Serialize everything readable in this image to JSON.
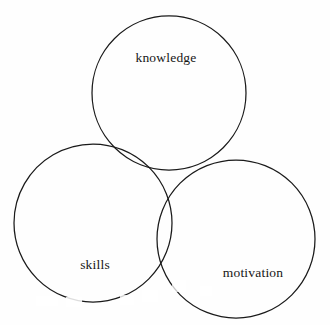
{
  "diagram": {
    "type": "three-circle-venn",
    "background_color": "#fefefe",
    "stroke_color": "#1a1a1a",
    "title": "",
    "circles": [
      {
        "id": "knowledge",
        "label": "knowledge",
        "position": "top",
        "cx": 169,
        "cy": 93,
        "r": 77
      },
      {
        "id": "skills",
        "label": "skills",
        "position": "bottom-left",
        "cx": 93,
        "cy": 223,
        "r": 79
      },
      {
        "id": "motivation",
        "label": "motivation",
        "position": "bottom-right",
        "cx": 236,
        "cy": 239,
        "r": 79
      }
    ]
  },
  "labels": {
    "knowledge": "knowledge",
    "skills": "skills",
    "motivation": "motivation"
  }
}
